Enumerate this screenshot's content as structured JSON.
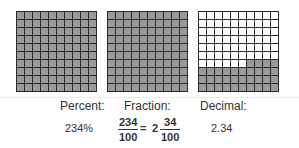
{
  "grids": [
    {
      "name": "grid-1",
      "shaded": 100,
      "left": 16
    },
    {
      "name": "grid-2",
      "shaded": 100,
      "left": 107
    },
    {
      "name": "grid-3",
      "shaded": 34,
      "left": 198
    }
  ],
  "colors": {
    "shaded": "#9a9a9a",
    "unshaded": "#ffffff",
    "lines": "#2a2a2a",
    "text": "#333333"
  },
  "labels": {
    "percent": "Percent:",
    "fraction": "Fraction:",
    "decimal": "Decimal:"
  },
  "values": {
    "percent": "234%",
    "fraction": {
      "improper_numerator": "234",
      "improper_denominator": "100",
      "equals": "=",
      "whole": "2",
      "mixed_numerator": "34",
      "mixed_denominator": "100"
    },
    "decimal": "2.34"
  }
}
